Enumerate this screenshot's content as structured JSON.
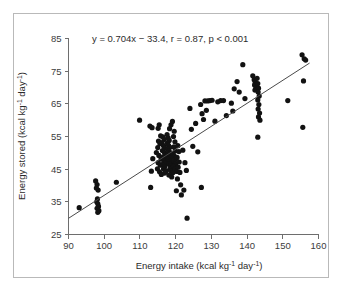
{
  "chart_data": {
    "type": "scatter",
    "title": "",
    "xlabel": "Energy intake (kcal kg⁻¹ day⁻¹)",
    "ylabel": "Energy stored (kcal kg⁻¹ day⁻¹)",
    "xlabel_parts": {
      "pre": "Energy intake (kcal kg",
      "sup1": "-1",
      "mid": " day",
      "sup2": "-1",
      "post": ")"
    },
    "ylabel_parts": {
      "pre": "Energy stored (kcal kg",
      "sup1": "-1",
      "mid": " day",
      "sup2": "-1",
      "post": ")"
    },
    "xlim": [
      90,
      160
    ],
    "ylim": [
      25,
      85
    ],
    "xticks": [
      90,
      100,
      110,
      120,
      130,
      140,
      150,
      160
    ],
    "yticks": [
      25,
      35,
      45,
      55,
      65,
      75,
      85
    ],
    "grid": false,
    "legend": null,
    "annotation": "y = 0.704x − 33.4, r = 0.87, p < 0.001",
    "fit": {
      "slope": 0.704,
      "intercept": -33.4,
      "r": 0.87,
      "p_text": "p < 0.001",
      "x_start": 90,
      "x_end": 157.5
    },
    "marker": {
      "shape": "circle",
      "radius": 2.6,
      "color": "#121212"
    },
    "point_count": 148,
    "points": [
      [
        93.0,
        33.2
      ],
      [
        97.6,
        41.4
      ],
      [
        98.0,
        40.3
      ],
      [
        97.8,
        39.2
      ],
      [
        98.3,
        38.6
      ],
      [
        98.1,
        35.9
      ],
      [
        97.9,
        35.0
      ],
      [
        98.2,
        34.4
      ],
      [
        98.4,
        33.6
      ],
      [
        98.0,
        33.0
      ],
      [
        98.5,
        32.3
      ],
      [
        98.2,
        31.8
      ],
      [
        103.4,
        41.0
      ],
      [
        109.9,
        60.0
      ],
      [
        112.8,
        58.2
      ],
      [
        113.4,
        57.7
      ],
      [
        113.2,
        44.4
      ],
      [
        113.6,
        48.2
      ],
      [
        113.0,
        39.4
      ],
      [
        115.1,
        57.5
      ],
      [
        115.4,
        58.6
      ],
      [
        115.8,
        55.2
      ],
      [
        115.2,
        53.6
      ],
      [
        115.6,
        52.8
      ],
      [
        115.0,
        51.6
      ],
      [
        114.6,
        50.1
      ],
      [
        115.3,
        49.2
      ],
      [
        115.9,
        48.1
      ],
      [
        115.1,
        47.0
      ],
      [
        115.7,
        46.2
      ],
      [
        114.9,
        45.1
      ],
      [
        115.5,
        44.2
      ],
      [
        116.0,
        43.4
      ],
      [
        116.4,
        54.9
      ],
      [
        116.8,
        54.1
      ],
      [
        116.2,
        53.1
      ],
      [
        116.6,
        52.2
      ],
      [
        117.0,
        51.4
      ],
      [
        116.3,
        50.7
      ],
      [
        116.9,
        50.0
      ],
      [
        117.2,
        49.4
      ],
      [
        116.5,
        48.8
      ],
      [
        117.1,
        48.2
      ],
      [
        116.7,
        47.6
      ],
      [
        117.3,
        47.0
      ],
      [
        116.1,
        46.4
      ],
      [
        117.0,
        45.8
      ],
      [
        116.6,
        45.1
      ],
      [
        117.4,
        44.5
      ],
      [
        116.9,
        43.8
      ],
      [
        117.6,
        55.6
      ],
      [
        117.9,
        54.6
      ],
      [
        118.2,
        53.8
      ],
      [
        117.7,
        53.0
      ],
      [
        118.0,
        52.3
      ],
      [
        118.4,
        51.7
      ],
      [
        117.8,
        51.1
      ],
      [
        118.1,
        50.5
      ],
      [
        118.6,
        50.0
      ],
      [
        117.9,
        49.5
      ],
      [
        118.3,
        49.0
      ],
      [
        118.7,
        48.5
      ],
      [
        118.0,
        48.0
      ],
      [
        118.5,
        47.5
      ],
      [
        118.9,
        47.0
      ],
      [
        118.2,
        46.5
      ],
      [
        118.6,
        46.0
      ],
      [
        119.0,
        45.5
      ],
      [
        118.4,
        45.0
      ],
      [
        118.8,
        44.4
      ],
      [
        119.2,
        43.9
      ],
      [
        118.1,
        43.2
      ],
      [
        118.9,
        42.6
      ],
      [
        119.4,
        55.0
      ],
      [
        119.8,
        53.4
      ],
      [
        119.5,
        51.8
      ],
      [
        119.9,
        50.6
      ],
      [
        119.3,
        49.7
      ],
      [
        119.7,
        48.9
      ],
      [
        120.1,
        48.2
      ],
      [
        119.6,
        47.4
      ],
      [
        120.0,
        46.7
      ],
      [
        119.4,
        45.9
      ],
      [
        119.9,
        45.1
      ],
      [
        120.3,
        44.3
      ],
      [
        120.6,
        52.2
      ],
      [
        120.9,
        50.4
      ],
      [
        120.4,
        48.6
      ],
      [
        121.0,
        47.2
      ],
      [
        120.7,
        45.6
      ],
      [
        121.2,
        44.0
      ],
      [
        120.5,
        42.0
      ],
      [
        121.4,
        40.2
      ],
      [
        120.2,
        38.4
      ],
      [
        121.6,
        37.1
      ],
      [
        119.1,
        59.6
      ],
      [
        118.7,
        58.6
      ],
      [
        118.3,
        57.4
      ],
      [
        119.6,
        56.6
      ],
      [
        122.0,
        50.8
      ],
      [
        122.6,
        47.0
      ],
      [
        123.0,
        44.6
      ],
      [
        122.3,
        38.6
      ],
      [
        123.2,
        30.0
      ],
      [
        124.0,
        63.6
      ],
      [
        124.4,
        57.2
      ],
      [
        124.8,
        52.0
      ],
      [
        125.6,
        59.0
      ],
      [
        126.2,
        50.3
      ],
      [
        127.0,
        64.8
      ],
      [
        127.4,
        62.0
      ],
      [
        127.8,
        60.2
      ],
      [
        128.2,
        65.9
      ],
      [
        128.6,
        63.0
      ],
      [
        127.2,
        39.4
      ],
      [
        129.0,
        65.9
      ],
      [
        129.6,
        66.0
      ],
      [
        130.2,
        66.1
      ],
      [
        131.0,
        59.7
      ],
      [
        131.8,
        65.6
      ],
      [
        132.6,
        66.0
      ],
      [
        133.4,
        66.0
      ],
      [
        134.2,
        61.4
      ],
      [
        135.6,
        65.2
      ],
      [
        136.4,
        69.6
      ],
      [
        136.0,
        62.8
      ],
      [
        137.2,
        71.8
      ],
      [
        137.8,
        68.6
      ],
      [
        138.8,
        77.0
      ],
      [
        139.4,
        66.6
      ],
      [
        141.6,
        73.6
      ],
      [
        142.0,
        72.4
      ],
      [
        142.3,
        71.6
      ],
      [
        142.1,
        70.8
      ],
      [
        142.5,
        70.0
      ],
      [
        142.2,
        69.2
      ],
      [
        142.8,
        72.8
      ],
      [
        143.0,
        71.2
      ],
      [
        143.2,
        69.8
      ],
      [
        143.1,
        68.6
      ],
      [
        143.4,
        67.4
      ],
      [
        143.0,
        66.2
      ],
      [
        143.3,
        64.8
      ],
      [
        143.1,
        63.4
      ],
      [
        143.5,
        62.2
      ],
      [
        143.2,
        61.0
      ],
      [
        143.6,
        60.0
      ],
      [
        143.0,
        54.8
      ],
      [
        151.4,
        66.0
      ],
      [
        155.4,
        80.0
      ],
      [
        156.0,
        78.8
      ],
      [
        156.4,
        78.4
      ],
      [
        155.8,
        72.0
      ],
      [
        155.6,
        57.8
      ]
    ]
  }
}
